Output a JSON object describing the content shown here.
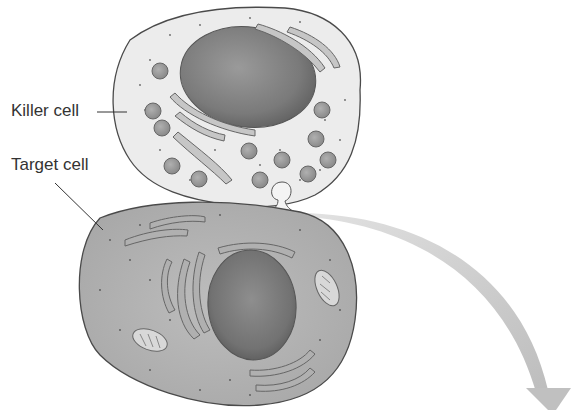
{
  "diagram": {
    "labels": {
      "killer_cell": "Killer cell",
      "target_cell": "Target cell"
    },
    "colors": {
      "killer_cytoplasm": "#ececec",
      "target_cytoplasm": "#b9b9b9",
      "nucleus": "#7a7a7a",
      "outline": "#4a4a4a",
      "arrow": "#c4c4c4",
      "text": "#333333"
    },
    "elements": [
      "killer-cell",
      "killer-nucleus",
      "killer-granules",
      "killer-er",
      "secretory-vesicle",
      "target-cell",
      "target-nucleus",
      "target-er",
      "mitochondria",
      "curved-arrow"
    ]
  }
}
